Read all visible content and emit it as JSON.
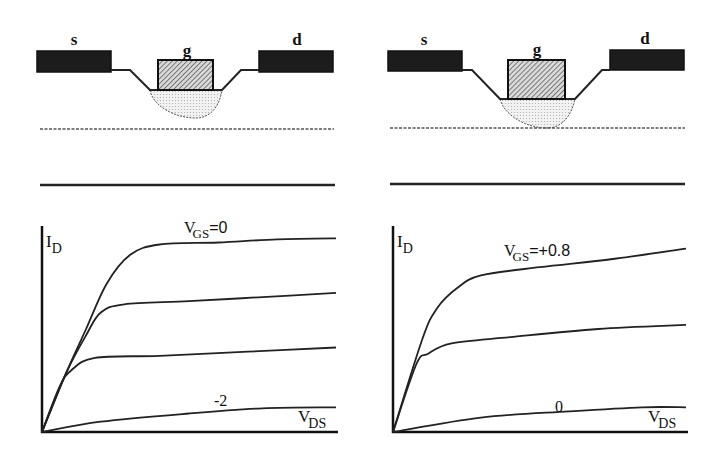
{
  "figure": {
    "panels": [
      {
        "id": "left",
        "device": {
          "labels": {
            "source": "s",
            "gate": "g",
            "drain": "d"
          },
          "depletion": "partial",
          "description": "Depletion region under gate does not reach dotted boundary"
        },
        "chart": {
          "y_label_main": "I",
          "y_label_sub": "D",
          "x_label_main": "V",
          "x_label_sub": "DS",
          "top_label_main": "V",
          "top_label_sub": "GS",
          "top_label_value": "=0",
          "bottom_label": "-2"
        }
      },
      {
        "id": "right",
        "device": {
          "labels": {
            "source": "s",
            "gate": "g",
            "drain": "d"
          },
          "depletion": "full",
          "description": "Depletion region touches dotted boundary"
        },
        "chart": {
          "y_label_main": "I",
          "y_label_sub": "D",
          "x_label_main": "V",
          "x_label_sub": "DS",
          "top_label_main": "V",
          "top_label_sub": "GS",
          "top_label_value": "=+0.8",
          "bottom_label": "0"
        }
      }
    ]
  },
  "chart_data": [
    {
      "type": "line",
      "title": "",
      "xlabel": "V_DS",
      "ylabel": "I_D",
      "xlim": [
        0,
        1
      ],
      "ylim": [
        0,
        1
      ],
      "grid": false,
      "series": [
        {
          "name": "V_GS=0",
          "points": [
            [
              0,
              0
            ],
            [
              0.08,
              0.28
            ],
            [
              0.15,
              0.5
            ],
            [
              0.22,
              0.72
            ],
            [
              0.3,
              0.86
            ],
            [
              0.4,
              0.91
            ],
            [
              0.6,
              0.92
            ],
            [
              0.8,
              0.935
            ],
            [
              1,
              0.94
            ]
          ]
        },
        {
          "name": "V_GS=-0.67",
          "points": [
            [
              0,
              0
            ],
            [
              0.08,
              0.28
            ],
            [
              0.15,
              0.47
            ],
            [
              0.2,
              0.58
            ],
            [
              0.28,
              0.62
            ],
            [
              0.5,
              0.635
            ],
            [
              0.75,
              0.655
            ],
            [
              1,
              0.675
            ]
          ]
        },
        {
          "name": "V_GS=-1.33",
          "points": [
            [
              0,
              0
            ],
            [
              0.06,
              0.22
            ],
            [
              0.1,
              0.3
            ],
            [
              0.18,
              0.36
            ],
            [
              0.4,
              0.37
            ],
            [
              0.7,
              0.39
            ],
            [
              1,
              0.41
            ]
          ]
        },
        {
          "name": "V_GS=-2",
          "points": [
            [
              0,
              0
            ],
            [
              0.2,
              0.05
            ],
            [
              0.5,
              0.09
            ],
            [
              0.75,
              0.115
            ],
            [
              1,
              0.12
            ]
          ]
        }
      ],
      "annotations": [
        "V_GS=0",
        "-2"
      ]
    },
    {
      "type": "line",
      "title": "",
      "xlabel": "V_DS",
      "ylabel": "I_D",
      "xlim": [
        0,
        1
      ],
      "ylim": [
        0,
        1
      ],
      "grid": false,
      "series": [
        {
          "name": "V_GS=+0.8",
          "points": [
            [
              0,
              0
            ],
            [
              0.1,
              0.45
            ],
            [
              0.15,
              0.6
            ],
            [
              0.22,
              0.7
            ],
            [
              0.3,
              0.76
            ],
            [
              0.5,
              0.8
            ],
            [
              0.75,
              0.84
            ],
            [
              1,
              0.89
            ]
          ]
        },
        {
          "name": "V_GS=+0.4",
          "points": [
            [
              0,
              0
            ],
            [
              0.08,
              0.33
            ],
            [
              0.12,
              0.38
            ],
            [
              0.2,
              0.43
            ],
            [
              0.4,
              0.46
            ],
            [
              0.7,
              0.5
            ],
            [
              1,
              0.52
            ]
          ]
        },
        {
          "name": "V_GS=0",
          "points": [
            [
              0,
              0
            ],
            [
              0.3,
              0.07
            ],
            [
              0.6,
              0.1
            ],
            [
              0.85,
              0.12
            ],
            [
              1,
              0.12
            ]
          ]
        }
      ],
      "annotations": [
        "V_GS=+0.8",
        "0"
      ]
    }
  ]
}
